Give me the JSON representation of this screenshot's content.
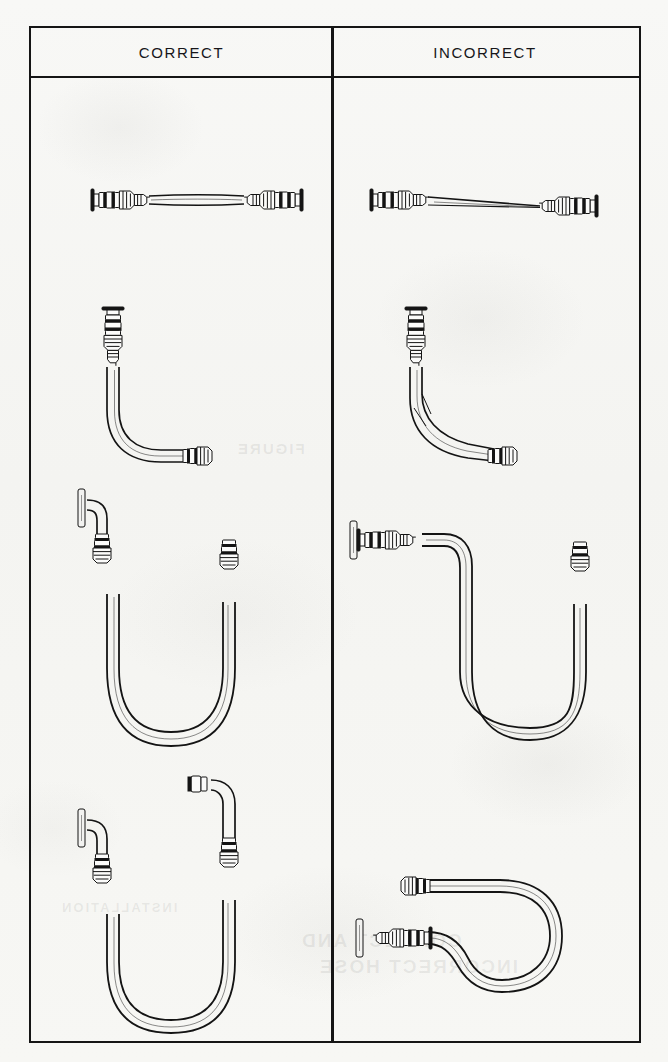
{
  "figure": {
    "kind": "technical-illustration",
    "columns": [
      "CORRECT",
      "INCORRECT"
    ],
    "row_count": 4
  },
  "header": {
    "correct_label": "CORRECT",
    "incorrect_label": "INCORRECT"
  },
  "rows": [
    {
      "index": 1,
      "correct": {
        "name": "straight-hose-slack",
        "description": "Straight hose run with slight slack between end fittings"
      },
      "incorrect": {
        "name": "straight-hose-taut",
        "description": "Hose stretched taut and too short between end fittings"
      }
    },
    {
      "index": 2,
      "correct": {
        "name": "ninety-degree-bend-generous-radius",
        "description": "Ninety degree hose bend with generous bend radius clear of the fitting"
      },
      "incorrect": {
        "name": "ninety-degree-bend-kinked-at-fitting",
        "description": "Hose kinked with a sharp bend starting right at the fitting"
      }
    },
    {
      "index": 3,
      "correct": {
        "name": "u-loop-with-elbow-fitting",
        "description": "U shaped loop using an elbow fitting at the bracket so the hose leaves straight"
      },
      "incorrect": {
        "name": "u-loop-sharp-bend-no-elbow",
        "description": "U shaped loop with no elbow, forcing a sharp bend next to the fitting"
      }
    },
    {
      "index": 4,
      "correct": {
        "name": "u-loop-both-ends-elbow",
        "description": "U shaped loop with elbow fittings at both ends, hose hangs in one plane"
      },
      "incorrect": {
        "name": "u-loop-twisted-sideways",
        "description": "Sideways loop that twists the hose out of plane between the two fittings"
      }
    }
  ],
  "ghost_text": {
    "line1": "FIGURE",
    "line2": "CORRECT AND",
    "line3": "INCORRECT HOSE",
    "line4": "INSTALLATION"
  },
  "colors": {
    "paper": "#f7f7f5",
    "ink": "#141414",
    "frame": "#151515"
  }
}
